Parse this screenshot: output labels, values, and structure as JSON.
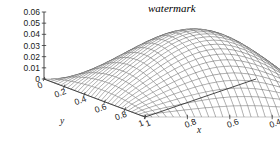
{
  "figure": {
    "kind": "3d-surface-mesh",
    "background": "#ffffff",
    "mesh_color": "#4a4a4a",
    "axis_color": "#333333",
    "text_color": "#1a1a1a",
    "watermark": "watermark"
  },
  "axes": {
    "z": {
      "label": "",
      "ticks": [
        "0.06",
        "0.05",
        "0.04",
        "0.03",
        "0.02",
        "0.01",
        "0"
      ],
      "values": [
        0.06,
        0.05,
        0.04,
        0.03,
        0.02,
        0.01,
        0
      ],
      "range": [
        0,
        0.06
      ]
    },
    "y": {
      "label": "y",
      "ticks": [
        "0",
        "0.2",
        "0.4",
        "0.6",
        "0.8",
        "1"
      ],
      "values": [
        0,
        0.2,
        0.4,
        0.6,
        0.8,
        1
      ],
      "range": [
        0,
        1
      ]
    },
    "x": {
      "label": "x",
      "ticks": [
        "1",
        "0.8",
        "0.6",
        "0.4",
        "0.2",
        "0"
      ],
      "values": [
        1,
        0.8,
        0.6,
        0.4,
        0.2,
        0
      ],
      "range": [
        0,
        1
      ]
    }
  },
  "chart_data": {
    "type": "surface",
    "title": "",
    "xlabel": "x",
    "ylabel": "y",
    "zlabel": "",
    "xlim": [
      0,
      1
    ],
    "ylim": [
      0,
      1
    ],
    "zlim": [
      0,
      0.06
    ],
    "xticks": [
      0,
      0.2,
      0.4,
      0.6,
      0.8,
      1
    ],
    "yticks": [
      0,
      0.2,
      0.4,
      0.6,
      0.8,
      1
    ],
    "zticks": [
      0,
      0.01,
      0.02,
      0.03,
      0.04,
      0.05,
      0.06
    ],
    "grid": false,
    "legend": null,
    "surface_peak_z": 0.06,
    "mesh_n": 30
  },
  "projection": {
    "origin_px": [
      44,
      79
    ],
    "front_px": [
      145,
      117
    ],
    "right_px": [
      256,
      79
    ],
    "z_top_px": [
      44,
      12
    ]
  }
}
